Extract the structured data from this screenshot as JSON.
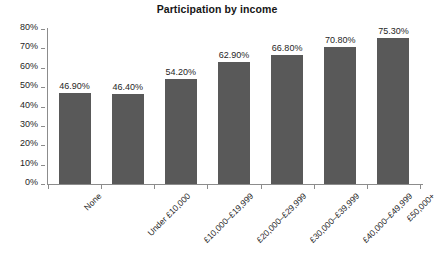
{
  "chart_data": {
    "type": "bar",
    "title": "Participation by income",
    "xlabel": "",
    "ylabel": "",
    "ylim": [
      0,
      80
    ],
    "grid": false,
    "legend": null,
    "categories": [
      "None",
      "Under £10,000",
      "£10,000–£19,999",
      "£20,000–£29,999",
      "£30,000–£39,999",
      "£40,000–£49,999",
      "£50,000+"
    ],
    "values": [
      46.9,
      46.4,
      54.2,
      62.9,
      66.8,
      70.8,
      75.3
    ],
    "value_labels": [
      "46.90%",
      "46.40%",
      "54.20%",
      "62.90%",
      "66.80%",
      "70.80%",
      "75.30%"
    ],
    "ytick_labels": [
      "0%",
      "10%",
      "20%",
      "30%",
      "40%",
      "50%",
      "60%",
      "70%",
      "80%"
    ],
    "ytick_values": [
      0,
      10,
      20,
      30,
      40,
      50,
      60,
      70,
      80
    ],
    "bar_color": "#595959",
    "axis_color": "#8c8c8c",
    "text_color": "#1f1f1f",
    "background": "#ffffff"
  }
}
